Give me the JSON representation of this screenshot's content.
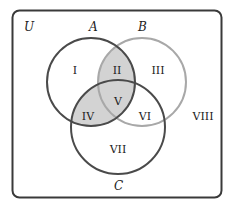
{
  "diagram": {
    "type": "venn-3",
    "universe_label": "U",
    "sets": [
      {
        "id": "A",
        "label": "A",
        "stroke": "#4a4a4a"
      },
      {
        "id": "B",
        "label": "B",
        "stroke": "#a8a8a8"
      },
      {
        "id": "C",
        "label": "C",
        "stroke": "#4a4a4a"
      }
    ],
    "regions": [
      {
        "id": "I",
        "label": "I",
        "description": "A only",
        "shaded": false
      },
      {
        "id": "II",
        "label": "II",
        "description": "A and B, not C",
        "shaded": true
      },
      {
        "id": "III",
        "label": "III",
        "description": "B only",
        "shaded": false
      },
      {
        "id": "IV",
        "label": "IV",
        "description": "A and C, not B",
        "shaded": true
      },
      {
        "id": "V",
        "label": "V",
        "description": "A, B and C",
        "shaded": true
      },
      {
        "id": "VI",
        "label": "VI",
        "description": "B and C, not A",
        "shaded": false
      },
      {
        "id": "VII",
        "label": "VII",
        "description": "C only",
        "shaded": false
      },
      {
        "id": "VIII",
        "label": "VIII",
        "description": "outside A, B, C",
        "shaded": false
      }
    ],
    "shaded_set_expression": "A ∩ (B ∪ C)",
    "colors": {
      "shade": "#d3d3d3",
      "border": "#3a3a3a",
      "background": "#ffffff"
    }
  }
}
